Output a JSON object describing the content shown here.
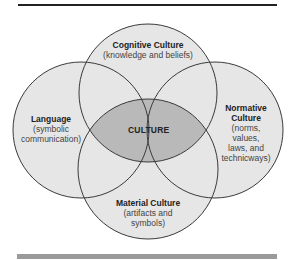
{
  "colors": {
    "background": "#ffffff",
    "circle_fill": "#e6e6e6",
    "center_fill": "#b9b9b9",
    "stroke": "#3a3a3a",
    "top_rule": "#222222",
    "bottom_rule": "#9a9a9a"
  },
  "diagram": {
    "type": "venn",
    "center": {
      "label": "CULTURE"
    },
    "circles": [
      {
        "id": "cognitive",
        "title": "Cognitive Culture",
        "desc": "(knowledge and beliefs)",
        "cx": 148,
        "cy": 93,
        "r": 69
      },
      {
        "id": "language",
        "title": "Language",
        "desc_lines": [
          "(symbolic",
          "communication)"
        ],
        "cx": 81,
        "cy": 130,
        "r": 68
      },
      {
        "id": "normative",
        "title_lines": [
          "Normative",
          "Culture"
        ],
        "desc_lines": [
          "(norms,",
          "values,",
          "laws, and",
          "technicways)"
        ],
        "cx": 215,
        "cy": 130,
        "r": 68
      },
      {
        "id": "material",
        "title": "Material Culture",
        "desc_lines": [
          "(artifacts and",
          "symbols)"
        ],
        "cx": 148,
        "cy": 169,
        "r": 70
      }
    ]
  }
}
